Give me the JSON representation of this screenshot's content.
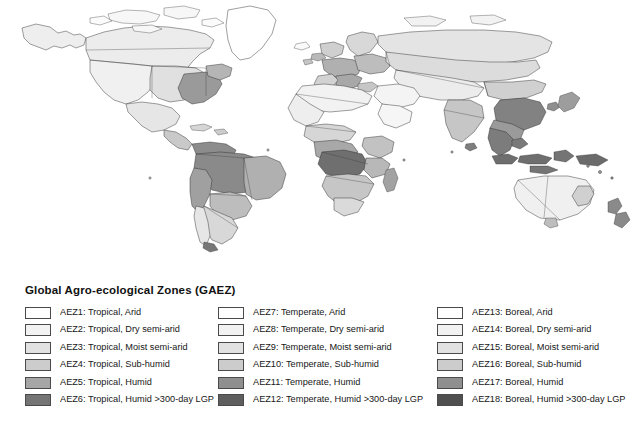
{
  "figure": {
    "map": {
      "name": "world-agro-ecological-zones-map",
      "projection": "equirectangular",
      "background_color": "#ffffff",
      "country_border_color": "#3a3a3a",
      "coastline_color": "#2b2b2b",
      "description": "Global raster map shading every country by Global Agro-ecological Zone class in greyscale"
    },
    "legend": {
      "title": "Global Agro-ecological Zones (GAEZ)",
      "columns": [
        {
          "name": "tropical-column",
          "items": [
            {
              "label": "AEZ1: Tropical, Arid",
              "color": "#fefefe"
            },
            {
              "label": "AEZ2: Tropical, Dry semi-arid",
              "color": "#f2f2f2"
            },
            {
              "label": "AEZ3: Tropical, Moist semi-arid",
              "color": "#e2e2e2"
            },
            {
              "label": "AEZ4: Tropical, Sub-humid",
              "color": "#cccccc"
            },
            {
              "label": "AEZ5: Tropical, Humid",
              "color": "#a6a6a6"
            },
            {
              "label": "AEZ6: Tropical, Humid >300-day LGP",
              "color": "#757575"
            }
          ]
        },
        {
          "name": "temperate-column",
          "items": [
            {
              "label": "AEZ7: Temperate, Arid",
              "color": "#fefefe"
            },
            {
              "label": "AEZ8: Temperate, Dry semi-arid",
              "color": "#f2f2f2"
            },
            {
              "label": "AEZ9: Temperate, Moist semi-arid",
              "color": "#e2e2e2"
            },
            {
              "label": "AEZ10: Temperate, Sub-humid",
              "color": "#cccccc"
            },
            {
              "label": "AEZ11: Temperate, Humid",
              "color": "#8f8f8f"
            },
            {
              "label": "AEZ12: Temperate, Humid >300-day LGP",
              "color": "#5e5e5e"
            }
          ]
        },
        {
          "name": "boreal-column",
          "items": [
            {
              "label": "AEZ13: Boreal, Arid",
              "color": "#fefefe"
            },
            {
              "label": "AEZ14: Boreal, Dry semi-arid",
              "color": "#f2f2f2"
            },
            {
              "label": "AEZ15: Boreal, Moist semi-arid",
              "color": "#e2e2e2"
            },
            {
              "label": "AEZ16: Boreal, Sub-humid",
              "color": "#cccccc"
            },
            {
              "label": "AEZ17: Boreal, Humid",
              "color": "#8f8f8f"
            },
            {
              "label": "AEZ18: Boreal, Humid >300-day LGP",
              "color": "#4f4f4f"
            }
          ]
        }
      ]
    }
  }
}
